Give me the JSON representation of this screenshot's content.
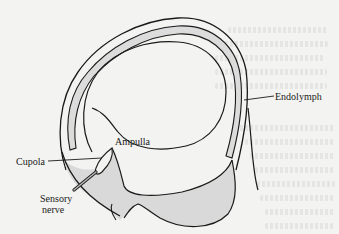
{
  "diagram": {
    "labels": {
      "endolymph": "Endolymph",
      "ampulla": "Ampulla",
      "cupola": "Cupola",
      "sensory_nerve_line1": "Sensory",
      "sensory_nerve_line2": "nerve"
    },
    "colors": {
      "background": "#f3f3f1",
      "stroke": "#1a1a1a",
      "fill_shaded": "#d9d9d9",
      "fill_canal": "#dcdcdc"
    }
  }
}
